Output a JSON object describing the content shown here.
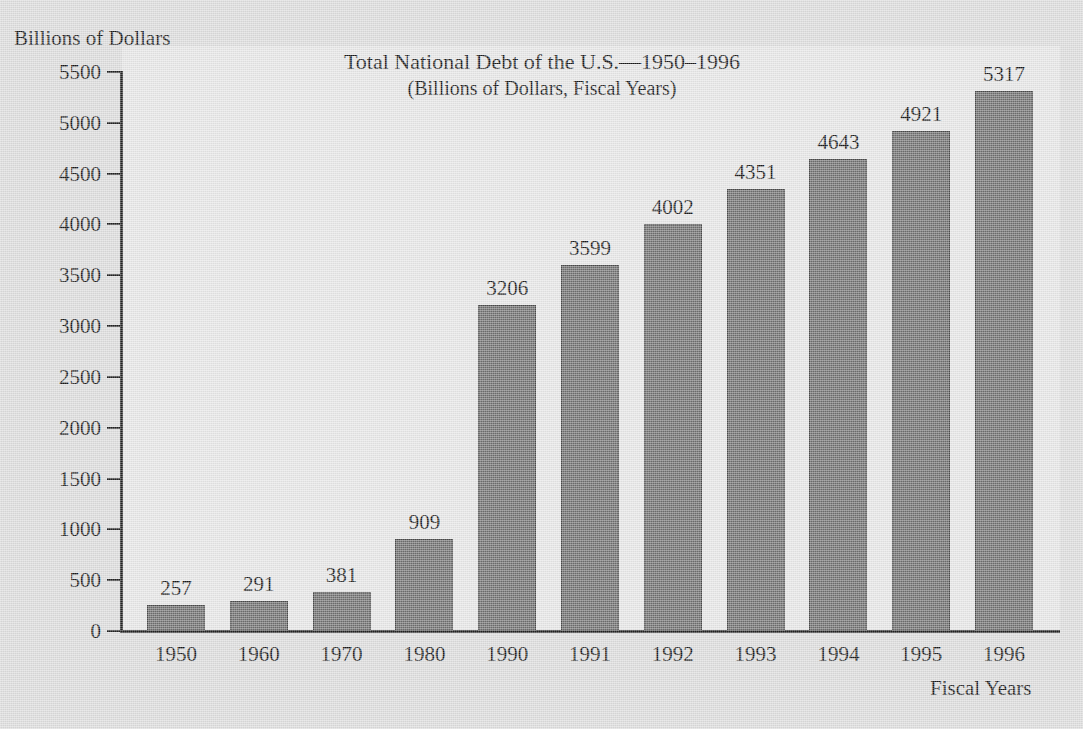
{
  "chart_data": {
    "type": "bar",
    "title": "Total National Debt of the U.S.—1950–1996",
    "subtitle": "(Billions of Dollars, Fiscal Years)",
    "ylabel": "Billions of Dollars",
    "xlabel": "Fiscal Years",
    "categories": [
      "1950",
      "1960",
      "1970",
      "1980",
      "1990",
      "1991",
      "1992",
      "1993",
      "1994",
      "1995",
      "1996"
    ],
    "values": [
      257,
      291,
      381,
      909,
      3206,
      3599,
      4002,
      4351,
      4643,
      4921,
      5317
    ],
    "value_labels": [
      "257",
      "291",
      "381",
      "909",
      "3206",
      "3599",
      "4002",
      "4351",
      "4643",
      "4921",
      "5317"
    ],
    "ylim": [
      0,
      5500
    ],
    "ytick_step": 500,
    "yticks": [
      0,
      500,
      1000,
      1500,
      2000,
      2500,
      3000,
      3500,
      4000,
      4500,
      5000,
      5500
    ],
    "ytick_labels": [
      "0",
      "500",
      "1000",
      "1500",
      "2000",
      "2500",
      "3000",
      "3500",
      "4000",
      "4500",
      "5000",
      "5500"
    ],
    "grid": false,
    "legend": false,
    "legend_position": "none",
    "bar_color": "#6f6f6f",
    "bar_edge_color": "#4a4a4a",
    "axis_color": "#222222",
    "background_color": "#dcdcdc",
    "plot_background_color": "#e6e6e6",
    "text_color": "#1a1a1a"
  }
}
